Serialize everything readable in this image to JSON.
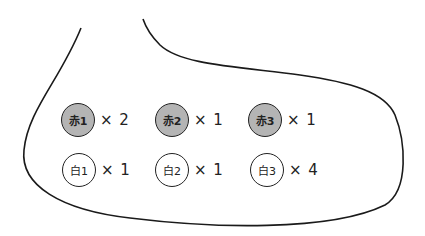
{
  "bag": {
    "balls": [
      {
        "label": "赤1",
        "count_text": "× 2",
        "color": "red",
        "x": 61,
        "y": 103
      },
      {
        "label": "赤2",
        "count_text": "× 1",
        "color": "red",
        "x": 155,
        "y": 103
      },
      {
        "label": "赤3",
        "count_text": "× 1",
        "color": "red",
        "x": 248,
        "y": 103
      },
      {
        "label": "白1",
        "count_text": "× 1",
        "color": "white",
        "x": 62,
        "y": 153
      },
      {
        "label": "白2",
        "count_text": "× 1",
        "color": "white",
        "x": 155,
        "y": 153
      },
      {
        "label": "白3",
        "count_text": "× 4",
        "color": "white",
        "x": 250,
        "y": 153
      }
    ],
    "fill_colors": {
      "red": "#b4b4b4",
      "white": "#ffffff"
    }
  }
}
